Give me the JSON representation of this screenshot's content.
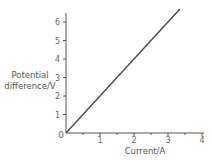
{
  "chart_data": {
    "type": "line",
    "title": "",
    "xlabel": "Current/A",
    "ylabel_line1": "Potential",
    "ylabel_line2": "difference/V",
    "xlim": [
      0,
      4
    ],
    "ylim": [
      0,
      6.5
    ],
    "x_ticks": [
      1,
      2,
      3,
      4
    ],
    "x_minor_ticks": [
      0.5,
      1.5,
      2.5,
      3.5
    ],
    "y_ticks": [
      1,
      2,
      3,
      4,
      5,
      6
    ],
    "origin_label": "0",
    "grid": false,
    "legend": null,
    "series": [
      {
        "name": "V-I",
        "x": [
          0,
          3.35
        ],
        "y": [
          0,
          6.7
        ],
        "color": "#444444"
      }
    ]
  }
}
